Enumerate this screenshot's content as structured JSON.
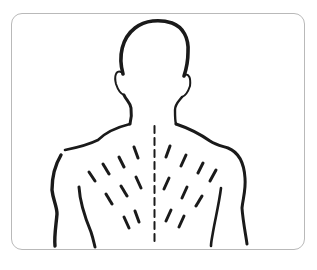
{
  "figure": {
    "frame_border_color": "#b9b9b9",
    "stroke_color": "#1a1a1a",
    "spine_style": "dashed",
    "stroke_marks_left": 10,
    "stroke_marks_right": 10
  }
}
